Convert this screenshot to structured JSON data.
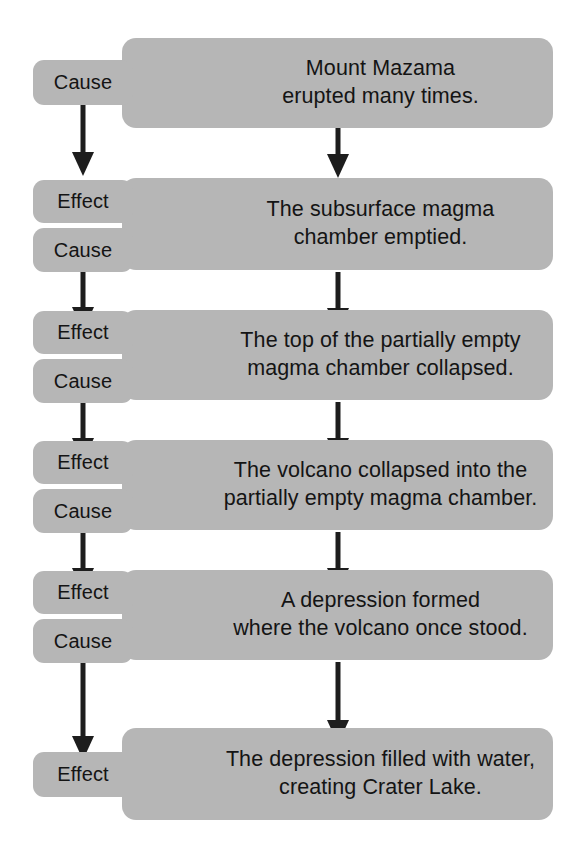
{
  "diagram": {
    "type": "cause-and-effect-chain",
    "colors": {
      "box_fill": "#b6b6b6",
      "text": "#141414",
      "arrow": "#1d1d1d",
      "background": "#ffffff"
    },
    "labels": {
      "cause": "Cause",
      "effect": "Effect"
    },
    "steps": [
      {
        "id": "step-1",
        "text": "Mount Mazama\nerupted many times.",
        "tags": [
          "Cause"
        ]
      },
      {
        "id": "step-2",
        "text": "The subsurface magma\nchamber emptied.",
        "tags": [
          "Effect",
          "Cause"
        ]
      },
      {
        "id": "step-3",
        "text": "The top of the partially empty\nmagma chamber collapsed.",
        "tags": [
          "Effect",
          "Cause"
        ]
      },
      {
        "id": "step-4",
        "text": "The volcano collapsed into the\npartially empty magma chamber.",
        "tags": [
          "Effect",
          "Cause"
        ]
      },
      {
        "id": "step-5",
        "text": "A depression formed\nwhere the volcano once stood.",
        "tags": [
          "Effect",
          "Cause"
        ]
      },
      {
        "id": "step-6",
        "text": "The depression filled with water,\ncreating Crater Lake.",
        "tags": [
          "Effect"
        ]
      }
    ],
    "connectors": [
      {
        "id": "connector-1-left",
        "from": "step-1",
        "to": "step-2"
      },
      {
        "id": "connector-1-center",
        "from": "step-1",
        "to": "step-2"
      },
      {
        "id": "connector-2-left",
        "from": "step-2",
        "to": "step-3"
      },
      {
        "id": "connector-2-center",
        "from": "step-2",
        "to": "step-3"
      },
      {
        "id": "connector-3-left",
        "from": "step-3",
        "to": "step-4"
      },
      {
        "id": "connector-3-center",
        "from": "step-3",
        "to": "step-4"
      },
      {
        "id": "connector-4-left",
        "from": "step-4",
        "to": "step-5"
      },
      {
        "id": "connector-4-center",
        "from": "step-4",
        "to": "step-5"
      },
      {
        "id": "connector-5-left",
        "from": "step-5",
        "to": "step-6"
      },
      {
        "id": "connector-5-center",
        "from": "step-5",
        "to": "step-6"
      }
    ]
  }
}
